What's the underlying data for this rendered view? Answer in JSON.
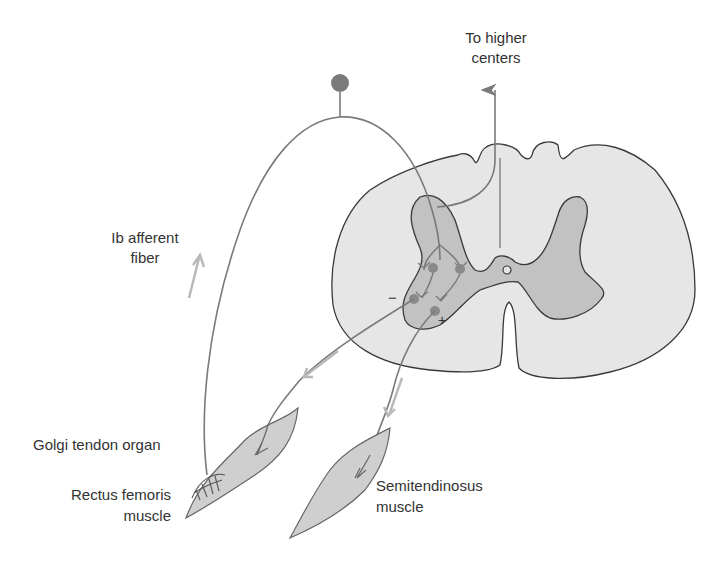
{
  "diagram": {
    "labels": {
      "higher_centers_line1": "To higher",
      "higher_centers_line2": "centers",
      "afferent_line1": "Ib afferent",
      "afferent_line2": "fiber",
      "golgi": "Golgi tendon organ",
      "rectus_line1": "Rectus femoris",
      "rectus_line2": "muscle",
      "semi_line1": "Semitendinosus",
      "semi_line2": "muscle",
      "minus_sign": "−",
      "plus_sign": "+"
    },
    "colors": {
      "white_matter": "#e6e6e6",
      "gray_matter": "#c2c2c2",
      "outline": "#3a3a3a",
      "nerve": "#7a7a7a",
      "arrow": "#b8b8b8",
      "neuron": "#8a8a8a",
      "muscle": "#cfcfcf",
      "text": "#333333"
    }
  }
}
